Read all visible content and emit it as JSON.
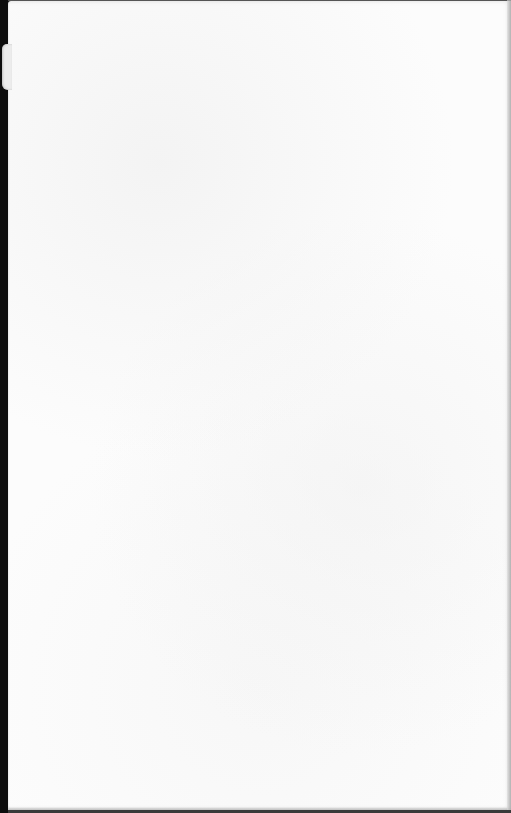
{
  "document": {
    "type": "blank scanned page",
    "text_content": "",
    "colors": {
      "page": "#fcfcfc",
      "background": "#0d0d0d",
      "tab": "#ececec"
    }
  }
}
